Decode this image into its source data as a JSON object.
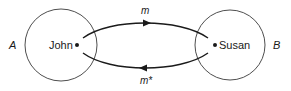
{
  "diagram": {
    "nodes": [
      {
        "id": "A",
        "set_label": "A",
        "person": "John"
      },
      {
        "id": "B",
        "set_label": "B",
        "person": "Susan"
      }
    ],
    "edges": [
      {
        "from": "John",
        "to": "Susan",
        "label": "m",
        "direction": "right"
      },
      {
        "from": "Susan",
        "to": "John",
        "label": "m*",
        "direction": "left"
      }
    ],
    "colors": {
      "stroke": "#1a1a1a",
      "circle": "#3a3a3a",
      "background": "#ffffff"
    }
  }
}
